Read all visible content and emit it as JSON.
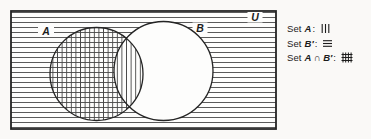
{
  "diagram": {
    "universal_label": "U",
    "set_a_label": "A",
    "set_b_label": "B",
    "regions": {
      "outside_both_circles": "horizontal-lines",
      "a_only": "crosshatch",
      "a_intersect_b": "vertical-lines",
      "b_only": "none"
    }
  },
  "legend": {
    "items": [
      {
        "prefix": "Set",
        "name": "A",
        "separator": ":",
        "pattern": "vertical-lines"
      },
      {
        "prefix": "Set",
        "name": "B′",
        "separator": ":",
        "pattern": "horizontal-lines"
      },
      {
        "prefix": "Set",
        "name": "A ∩ B′",
        "separator": ":",
        "pattern": "crosshatch-grid"
      }
    ]
  },
  "colors": {
    "hatch_line": "#474747",
    "outline": "#242424",
    "region_fill": "#fdfdfc",
    "page_background": "#faf9f7",
    "text": "#1c1c1c"
  }
}
